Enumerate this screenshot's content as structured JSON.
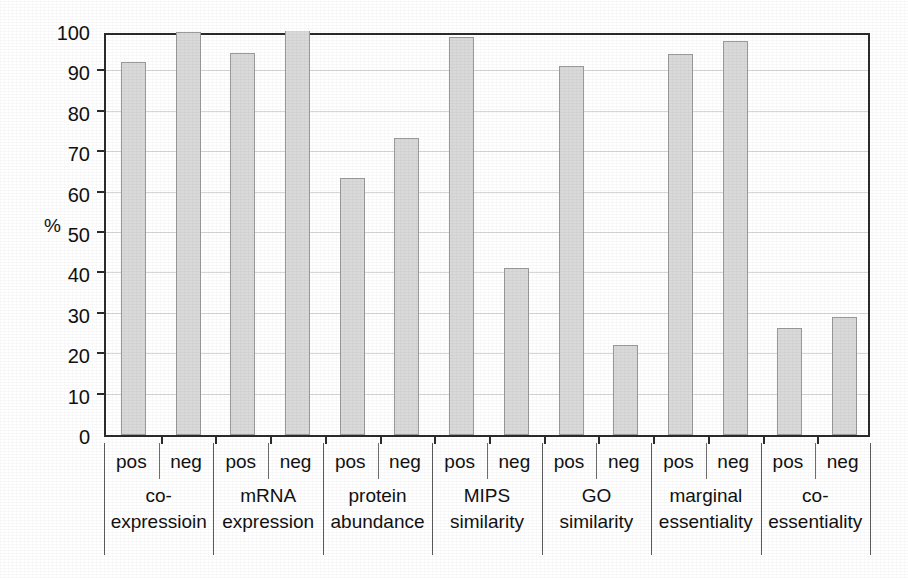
{
  "chart_data": {
    "type": "bar",
    "title": "",
    "xlabel": "",
    "ylabel": "%",
    "ylim": [
      0,
      100
    ],
    "ytick_step": 10,
    "grid": true,
    "legend": "none",
    "bar_fill_color": "#d9d9d9",
    "bar_border_color": "#9a9a9a",
    "axis_color": "#2b2b2b",
    "gridline_color": "#d7d7d7",
    "yticks": [
      "0",
      "10",
      "20",
      "30",
      "40",
      "50",
      "60",
      "70",
      "80",
      "90",
      "100"
    ],
    "subcategories": [
      "pos",
      "neg"
    ],
    "categories": [
      "co-expressioin",
      "mRNA expression",
      "protein abundance",
      "MIPS similarity",
      "GO similarity",
      "marginal essentiality",
      "co-essentiality"
    ],
    "category_lines": [
      [
        "co-",
        "expressioin"
      ],
      [
        "mRNA",
        "expression"
      ],
      [
        "protein",
        "abundance"
      ],
      [
        "MIPS",
        "similarity"
      ],
      [
        "GO",
        "similarity"
      ],
      [
        "marginal",
        "essentiality"
      ],
      [
        "co-",
        "essentiality"
      ]
    ],
    "series": [
      {
        "name": "pos",
        "values": [
          92.3,
          94.5,
          63.5,
          98.5,
          91.4,
          94.2,
          26.4
        ]
      },
      {
        "name": "neg",
        "values": [
          99.7,
          100.0,
          73.5,
          41.4,
          22.3,
          97.6,
          29.3
        ]
      }
    ],
    "bars": [
      {
        "category": "co-expressioin",
        "sub": "pos",
        "value": 92.3
      },
      {
        "category": "co-expressioin",
        "sub": "neg",
        "value": 99.7
      },
      {
        "category": "mRNA expression",
        "sub": "pos",
        "value": 94.5
      },
      {
        "category": "mRNA expression",
        "sub": "neg",
        "value": 100.0
      },
      {
        "category": "protein abundance",
        "sub": "pos",
        "value": 63.5
      },
      {
        "category": "protein abundance",
        "sub": "neg",
        "value": 73.5
      },
      {
        "category": "MIPS similarity",
        "sub": "pos",
        "value": 98.5
      },
      {
        "category": "MIPS similarity",
        "sub": "neg",
        "value": 41.4
      },
      {
        "category": "GO similarity",
        "sub": "pos",
        "value": 91.4
      },
      {
        "category": "GO similarity",
        "sub": "neg",
        "value": 22.3
      },
      {
        "category": "marginal essentiality",
        "sub": "pos",
        "value": 94.2
      },
      {
        "category": "marginal essentiality",
        "sub": "neg",
        "value": 97.6
      },
      {
        "category": "co-essentiality",
        "sub": "pos",
        "value": 26.4
      },
      {
        "category": "co-essentiality",
        "sub": "neg",
        "value": 29.3
      }
    ]
  }
}
